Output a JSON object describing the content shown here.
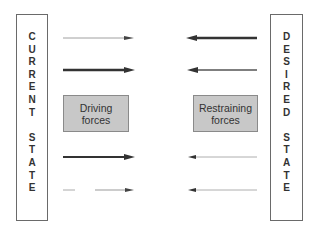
{
  "current_state": {
    "word1": [
      "C",
      "U",
      "R",
      "R",
      "E",
      "N",
      "T"
    ],
    "word2": [
      "S",
      "T",
      "A",
      "T",
      "E"
    ]
  },
  "desired_state": {
    "word1": [
      "D",
      "E",
      "S",
      "I",
      "R",
      "E",
      "D"
    ],
    "word2": [
      "S",
      "T",
      "A",
      "T",
      "E"
    ]
  },
  "driving_box": {
    "line1": "Driving",
    "line2": "forces"
  },
  "restraining_box": {
    "line1": "Restraining",
    "line2": "forces"
  },
  "driving_arrows": [
    {
      "direction": "right",
      "strength": "weak"
    },
    {
      "direction": "right",
      "strength": "strong"
    },
    {
      "direction": "right",
      "strength": "strong"
    },
    {
      "direction": "right",
      "strength": "weak-dashed"
    }
  ],
  "restraining_arrows": [
    {
      "direction": "left",
      "strength": "strong"
    },
    {
      "direction": "left",
      "strength": "medium"
    },
    {
      "direction": "left",
      "strength": "weak"
    },
    {
      "direction": "left",
      "strength": "weak"
    }
  ],
  "colors": {
    "box_fill": "#c8c8c8",
    "border": "#6a6a6a",
    "arrow": "#333333"
  }
}
